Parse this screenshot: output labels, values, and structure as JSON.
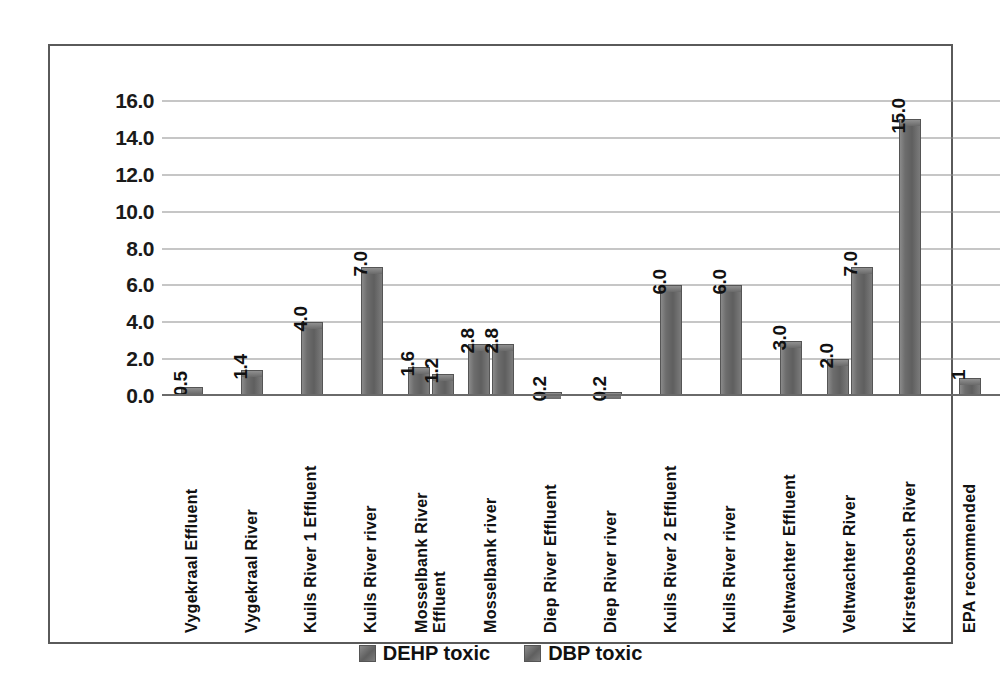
{
  "chart_data": {
    "type": "bar",
    "title": "",
    "subtitle": "",
    "xlabel": "",
    "ylabel": "",
    "ylim": [
      0,
      16
    ],
    "y_ticks": [
      "0.0",
      "2.0",
      "4.0",
      "6.0",
      "8.0",
      "10.0",
      "12.0",
      "14.0",
      "16.0"
    ],
    "y_tick_values": [
      0,
      2,
      4,
      6,
      8,
      10,
      12,
      14,
      16
    ],
    "grid": true,
    "legend_position": "bottom",
    "categories": [
      "Vygekraal Effluent",
      "Vygekraal River",
      "Kuils River 1 Effluent",
      "Kuils River river",
      "Mosselbank River\nEffluent",
      "Mosselbank river",
      "Diep River Effluent",
      "Diep River river",
      "Kuils River 2 Effluent",
      "Kuils River river",
      "Veltwachter Effluent",
      "Veltwachter River",
      "Kirstenbosch River",
      "EPA recommended"
    ],
    "series": [
      {
        "name": "DEHP toxic",
        "color": "#6d6d6d",
        "values": [
          0.5,
          1.4,
          4.0,
          7.0,
          1.6,
          2.8,
          0.2,
          0.2,
          6.0,
          6.0,
          3.0,
          2.0,
          15.0,
          1
        ],
        "labels": [
          "0.5",
          "1.4",
          "4.0",
          "7.0",
          "1.6",
          "2.8",
          "0.2",
          "0.2",
          "6.0",
          "6.0",
          "3.0",
          "2.0",
          "15.0",
          "1"
        ]
      },
      {
        "name": "DBP toxic",
        "color": "#7b7b7b",
        "values": [
          null,
          null,
          null,
          null,
          1.2,
          2.8,
          null,
          null,
          null,
          null,
          null,
          7.0,
          null,
          null
        ],
        "labels": [
          null,
          null,
          null,
          null,
          "1.2",
          "2.8",
          null,
          null,
          null,
          null,
          null,
          "7.0",
          null,
          null
        ]
      }
    ]
  },
  "legend": {
    "items": [
      {
        "label": "DEHP toxic"
      },
      {
        "label": "DBP toxic"
      }
    ]
  },
  "colors": {
    "bar_fill": "#6d6d6d",
    "gridline": "#8d8d8d",
    "frame": "#5a5a5a",
    "text": "#111111",
    "background": "#ffffff"
  }
}
